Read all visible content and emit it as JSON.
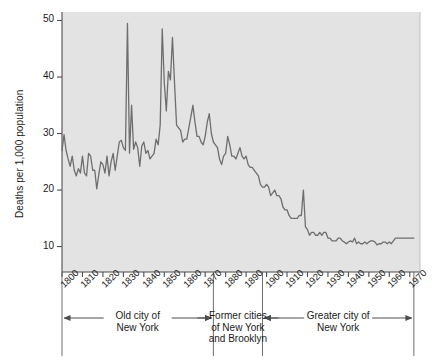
{
  "chart_data": {
    "type": "line",
    "title": "",
    "xlabel": "",
    "ylabel": "Deaths per 1,000 population",
    "xlim": [
      1800,
      1975
    ],
    "ylim": [
      5.5,
      51.5
    ],
    "yticks": [
      10,
      20,
      30,
      40,
      50
    ],
    "ytick_labels": [
      "10",
      "20",
      "30",
      "40",
      "50"
    ],
    "xticks": [
      1800,
      1810,
      1820,
      1830,
      1840,
      1850,
      1860,
      1870,
      1880,
      1890,
      1900,
      1910,
      1920,
      1930,
      1940,
      1950,
      1960,
      1970
    ],
    "xtick_labels": [
      "1800",
      "1810",
      "1820",
      "1830",
      "1840",
      "1850",
      "1860",
      "1870",
      "1880",
      "1890",
      "1900",
      "1910",
      "1920",
      "1930",
      "1940",
      "1950",
      "1960",
      "1970"
    ],
    "grid": false,
    "legend": "none",
    "line_color": "#6e6e6e",
    "plot_background": "#e3e3e3",
    "figure_background": "#ffffff",
    "series": [
      {
        "name": "Crude death rate, New York City",
        "x": [
          1800,
          1801,
          1802,
          1803,
          1804,
          1805,
          1806,
          1807,
          1808,
          1809,
          1810,
          1811,
          1812,
          1813,
          1814,
          1815,
          1816,
          1817,
          1818,
          1819,
          1820,
          1821,
          1822,
          1823,
          1824,
          1825,
          1826,
          1827,
          1828,
          1829,
          1830,
          1831,
          1832,
          1833,
          1834,
          1835,
          1836,
          1837,
          1838,
          1839,
          1840,
          1841,
          1842,
          1843,
          1844,
          1845,
          1846,
          1847,
          1848,
          1849,
          1850,
          1851,
          1852,
          1853,
          1854,
          1855,
          1856,
          1857,
          1858,
          1859,
          1860,
          1861,
          1862,
          1863,
          1864,
          1865,
          1866,
          1867,
          1868,
          1869,
          1870,
          1871,
          1872,
          1873,
          1874,
          1875,
          1876,
          1877,
          1878,
          1879,
          1880,
          1881,
          1882,
          1883,
          1884,
          1885,
          1886,
          1887,
          1888,
          1889,
          1890,
          1891,
          1892,
          1893,
          1894,
          1895,
          1896,
          1897,
          1898,
          1899,
          1900,
          1901,
          1902,
          1903,
          1904,
          1905,
          1906,
          1907,
          1908,
          1909,
          1910,
          1911,
          1912,
          1913,
          1914,
          1915,
          1916,
          1917,
          1918,
          1919,
          1920,
          1921,
          1922,
          1923,
          1924,
          1925,
          1926,
          1927,
          1928,
          1929,
          1930,
          1931,
          1932,
          1933,
          1934,
          1935,
          1936,
          1937,
          1938,
          1939,
          1940,
          1941,
          1942,
          1943,
          1944,
          1945,
          1946,
          1947,
          1948,
          1949,
          1950,
          1951,
          1952,
          1953,
          1954,
          1955,
          1956,
          1957,
          1958,
          1959,
          1960,
          1961,
          1962,
          1963,
          1964,
          1965,
          1966,
          1967,
          1968,
          1969,
          1970,
          1971,
          1972
        ],
        "values": [
          27.0,
          29.8,
          27.0,
          25.5,
          24.2,
          26.0,
          23.5,
          22.5,
          23.8,
          23.0,
          26.0,
          23.0,
          22.5,
          26.5,
          26.0,
          23.5,
          23.5,
          20.2,
          22.8,
          25.0,
          24.5,
          23.0,
          26.0,
          22.5,
          25.0,
          26.5,
          23.5,
          26.0,
          28.5,
          28.8,
          27.5,
          27.0,
          49.5,
          26.5,
          35.0,
          27.2,
          28.5,
          27.5,
          24.2,
          27.8,
          28.5,
          26.5,
          27.0,
          25.5,
          26.0,
          26.5,
          29.0,
          28.0,
          31.5,
          48.5,
          39.0,
          34.0,
          41.0,
          39.5,
          47.0,
          39.0,
          31.5,
          31.0,
          30.5,
          28.5,
          29.0,
          29.0,
          31.0,
          33.0,
          35.0,
          32.0,
          29.5,
          29.5,
          28.5,
          28.0,
          29.5,
          32.0,
          33.5,
          30.0,
          28.5,
          28.0,
          27.5,
          25.5,
          24.5,
          26.0,
          26.5,
          29.5,
          28.0,
          26.0,
          26.0,
          25.5,
          26.5,
          27.5,
          26.0,
          25.5,
          26.0,
          24.5,
          24.0,
          24.0,
          23.5,
          23.0,
          22.5,
          21.0,
          20.5,
          20.5,
          21.0,
          20.5,
          19.0,
          19.5,
          20.0,
          19.0,
          19.0,
          18.5,
          17.0,
          16.5,
          16.5,
          15.5,
          15.0,
          15.0,
          15.0,
          15.0,
          15.5,
          15.5,
          20.0,
          13.5,
          13.0,
          12.0,
          12.5,
          12.5,
          12.0,
          12.0,
          12.5,
          12.0,
          12.5,
          12.5,
          11.5,
          11.5,
          11.0,
          11.0,
          11.0,
          11.5,
          11.5,
          11.0,
          10.8,
          10.5,
          10.8,
          11.0,
          10.8,
          11.5,
          10.5,
          10.8,
          10.5,
          10.5,
          10.8,
          10.5,
          10.8,
          11.0,
          11.0,
          10.8,
          10.3,
          10.5,
          10.5,
          10.8,
          10.8,
          10.5,
          10.8,
          10.5,
          11.0,
          11.5,
          11.5,
          11.5,
          11.5,
          11.5,
          11.5,
          11.5,
          11.5,
          11.5,
          11.5
        ]
      }
    ],
    "annotations": {
      "periods": [
        {
          "label": "Old city of\nNew York",
          "start_year": 1800,
          "end_year": 1874,
          "arrow": "both"
        },
        {
          "label": "Former cities\nof New York\nand Brooklyn",
          "start_year": 1874,
          "end_year": 1898,
          "arrow": "none"
        },
        {
          "label": "Greater city of\nNew York",
          "start_year": 1898,
          "end_year": 1972,
          "arrow": "both"
        }
      ]
    }
  }
}
